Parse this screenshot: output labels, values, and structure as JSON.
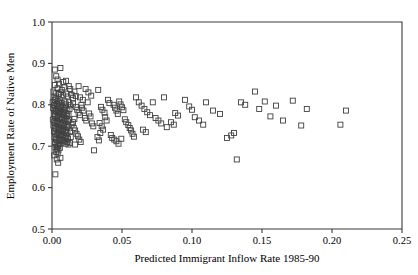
{
  "chart_data": {
    "type": "scatter",
    "title": "",
    "xlabel": "Predicted Immigrant Inflow Rate 1985-90",
    "ylabel": "Employment Rate of Native Men",
    "xlim": [
      0.0,
      0.25
    ],
    "ylim": [
      0.5,
      1.0
    ],
    "xticks": [
      0.0,
      0.05,
      0.1,
      0.15,
      0.2,
      0.25
    ],
    "xticklabels": [
      "0.00",
      "0.05",
      "0.10",
      "0.15",
      "0.20",
      "0.25"
    ],
    "yticks": [
      0.5,
      0.6,
      0.7,
      0.8,
      0.9,
      1.0
    ],
    "yticklabels": [
      "0.5",
      "0.6",
      "0.7",
      "0.8",
      "0.9",
      "1.0"
    ],
    "grid": false,
    "legend": null,
    "marker": "open-square",
    "marker_color": "#404040",
    "marker_size": 5,
    "series": [
      {
        "name": "metro areas",
        "points": [
          [
            0.002,
            0.885
          ],
          [
            0.006,
            0.889
          ],
          [
            0.004,
            0.861
          ],
          [
            0.003,
            0.869
          ],
          [
            0.005,
            0.851
          ],
          [
            0.008,
            0.855
          ],
          [
            0.01,
            0.858
          ],
          [
            0.012,
            0.845
          ],
          [
            0.002,
            0.848
          ],
          [
            0.004,
            0.84
          ],
          [
            0.007,
            0.836
          ],
          [
            0.009,
            0.842
          ],
          [
            0.013,
            0.838
          ],
          [
            0.016,
            0.832
          ],
          [
            0.019,
            0.845
          ],
          [
            0.024,
            0.838
          ],
          [
            0.001,
            0.832
          ],
          [
            0.003,
            0.828
          ],
          [
            0.005,
            0.826
          ],
          [
            0.006,
            0.83
          ],
          [
            0.008,
            0.823
          ],
          [
            0.01,
            0.827
          ],
          [
            0.011,
            0.82
          ],
          [
            0.014,
            0.824
          ],
          [
            0.015,
            0.816
          ],
          [
            0.017,
            0.821
          ],
          [
            0.02,
            0.818
          ],
          [
            0.022,
            0.812
          ],
          [
            0.001,
            0.818
          ],
          [
            0.002,
            0.812
          ],
          [
            0.003,
            0.815
          ],
          [
            0.004,
            0.809
          ],
          [
            0.005,
            0.806
          ],
          [
            0.006,
            0.811
          ],
          [
            0.007,
            0.804
          ],
          [
            0.009,
            0.808
          ],
          [
            0.01,
            0.801
          ],
          [
            0.012,
            0.806
          ],
          [
            0.013,
            0.799
          ],
          [
            0.015,
            0.803
          ],
          [
            0.0005,
            0.806
          ],
          [
            0.0015,
            0.8
          ],
          [
            0.0025,
            0.797
          ],
          [
            0.0035,
            0.802
          ],
          [
            0.0045,
            0.794
          ],
          [
            0.0055,
            0.798
          ],
          [
            0.0065,
            0.791
          ],
          [
            0.0075,
            0.795
          ],
          [
            0.0085,
            0.788
          ],
          [
            0.0095,
            0.792
          ],
          [
            0.011,
            0.786
          ],
          [
            0.0125,
            0.79
          ],
          [
            0.0008,
            0.792
          ],
          [
            0.0018,
            0.787
          ],
          [
            0.0028,
            0.784
          ],
          [
            0.0038,
            0.789
          ],
          [
            0.0048,
            0.781
          ],
          [
            0.0058,
            0.785
          ],
          [
            0.0068,
            0.778
          ],
          [
            0.0078,
            0.782
          ],
          [
            0.0088,
            0.776
          ],
          [
            0.0098,
            0.78
          ],
          [
            0.0108,
            0.773
          ],
          [
            0.0118,
            0.777
          ],
          [
            0.0012,
            0.778
          ],
          [
            0.0022,
            0.773
          ],
          [
            0.0032,
            0.77
          ],
          [
            0.0042,
            0.775
          ],
          [
            0.0052,
            0.768
          ],
          [
            0.0062,
            0.771
          ],
          [
            0.0072,
            0.765
          ],
          [
            0.0082,
            0.769
          ],
          [
            0.0092,
            0.762
          ],
          [
            0.0102,
            0.766
          ],
          [
            0.0112,
            0.76
          ],
          [
            0.0122,
            0.764
          ],
          [
            0.0006,
            0.764
          ],
          [
            0.0016,
            0.759
          ],
          [
            0.0026,
            0.756
          ],
          [
            0.0036,
            0.761
          ],
          [
            0.0046,
            0.754
          ],
          [
            0.0056,
            0.757
          ],
          [
            0.0066,
            0.751
          ],
          [
            0.0076,
            0.755
          ],
          [
            0.0086,
            0.748
          ],
          [
            0.0096,
            0.752
          ],
          [
            0.0106,
            0.746
          ],
          [
            0.0116,
            0.75
          ],
          [
            0.001,
            0.75
          ],
          [
            0.002,
            0.745
          ],
          [
            0.003,
            0.742
          ],
          [
            0.004,
            0.747
          ],
          [
            0.005,
            0.74
          ],
          [
            0.006,
            0.743
          ],
          [
            0.007,
            0.737
          ],
          [
            0.008,
            0.741
          ],
          [
            0.009,
            0.734
          ],
          [
            0.01,
            0.738
          ],
          [
            0.011,
            0.732
          ],
          [
            0.013,
            0.736
          ],
          [
            0.0014,
            0.736
          ],
          [
            0.0024,
            0.731
          ],
          [
            0.0034,
            0.728
          ],
          [
            0.0044,
            0.733
          ],
          [
            0.0054,
            0.726
          ],
          [
            0.0064,
            0.729
          ],
          [
            0.0074,
            0.723
          ],
          [
            0.0084,
            0.727
          ],
          [
            0.0094,
            0.72
          ],
          [
            0.0104,
            0.724
          ],
          [
            0.0114,
            0.718
          ],
          [
            0.0134,
            0.722
          ],
          [
            0.0018,
            0.722
          ],
          [
            0.0028,
            0.717
          ],
          [
            0.0038,
            0.714
          ],
          [
            0.0048,
            0.719
          ],
          [
            0.0058,
            0.712
          ],
          [
            0.0068,
            0.715
          ],
          [
            0.0078,
            0.709
          ],
          [
            0.0088,
            0.713
          ],
          [
            0.0098,
            0.706
          ],
          [
            0.0108,
            0.71
          ],
          [
            0.0118,
            0.704
          ],
          [
            0.0128,
            0.708
          ],
          [
            0.0022,
            0.708
          ],
          [
            0.0032,
            0.703
          ],
          [
            0.0042,
            0.7
          ],
          [
            0.0052,
            0.705
          ],
          [
            0.0026,
            0.698
          ],
          [
            0.0036,
            0.694
          ],
          [
            0.0046,
            0.69
          ],
          [
            0.0056,
            0.696
          ],
          [
            0.003,
            0.686
          ],
          [
            0.004,
            0.682
          ],
          [
            0.0016,
            0.678
          ],
          [
            0.006,
            0.672
          ],
          [
            0.0034,
            0.668
          ],
          [
            0.0044,
            0.66
          ],
          [
            0.0024,
            0.632
          ],
          [
            0.017,
            0.795
          ],
          [
            0.018,
            0.788
          ],
          [
            0.019,
            0.781
          ],
          [
            0.02,
            0.775
          ],
          [
            0.021,
            0.8
          ],
          [
            0.0215,
            0.793
          ],
          [
            0.0225,
            0.786
          ],
          [
            0.0235,
            0.768
          ],
          [
            0.0245,
            0.762
          ],
          [
            0.0255,
            0.806
          ],
          [
            0.0265,
            0.779
          ],
          [
            0.0275,
            0.772
          ],
          [
            0.0285,
            0.755
          ],
          [
            0.0295,
            0.748
          ],
          [
            0.016,
            0.766
          ],
          [
            0.015,
            0.758
          ],
          [
            0.014,
            0.752
          ],
          [
            0.0155,
            0.744
          ],
          [
            0.0165,
            0.738
          ],
          [
            0.0175,
            0.73
          ],
          [
            0.0185,
            0.724
          ],
          [
            0.0195,
            0.716
          ],
          [
            0.0205,
            0.71
          ],
          [
            0.0165,
            0.704
          ],
          [
            0.03,
            0.69
          ],
          [
            0.028,
            0.822
          ],
          [
            0.026,
            0.83
          ],
          [
            0.033,
            0.836
          ],
          [
            0.035,
            0.795
          ],
          [
            0.036,
            0.788
          ],
          [
            0.0375,
            0.781
          ],
          [
            0.038,
            0.77
          ],
          [
            0.039,
            0.762
          ],
          [
            0.04,
            0.812
          ],
          [
            0.041,
            0.804
          ],
          [
            0.034,
            0.756
          ],
          [
            0.0355,
            0.748
          ],
          [
            0.0365,
            0.74
          ],
          [
            0.0345,
            0.732
          ],
          [
            0.042,
            0.727
          ],
          [
            0.043,
            0.72
          ],
          [
            0.0325,
            0.722
          ],
          [
            0.0335,
            0.714
          ],
          [
            0.044,
            0.8
          ],
          [
            0.045,
            0.793
          ],
          [
            0.046,
            0.786
          ],
          [
            0.047,
            0.778
          ],
          [
            0.048,
            0.808
          ],
          [
            0.049,
            0.801
          ],
          [
            0.05,
            0.794
          ],
          [
            0.051,
            0.787
          ],
          [
            0.052,
            0.765
          ],
          [
            0.053,
            0.758
          ],
          [
            0.0545,
            0.751
          ],
          [
            0.0555,
            0.744
          ],
          [
            0.0565,
            0.738
          ],
          [
            0.0575,
            0.73
          ],
          [
            0.0585,
            0.723
          ],
          [
            0.0495,
            0.718
          ],
          [
            0.046,
            0.712
          ],
          [
            0.0475,
            0.706
          ],
          [
            0.0445,
            0.716
          ],
          [
            0.06,
            0.818
          ],
          [
            0.062,
            0.806
          ],
          [
            0.064,
            0.798
          ],
          [
            0.066,
            0.79
          ],
          [
            0.068,
            0.782
          ],
          [
            0.07,
            0.775
          ],
          [
            0.072,
            0.806
          ],
          [
            0.074,
            0.768
          ],
          [
            0.076,
            0.762
          ],
          [
            0.078,
            0.755
          ],
          [
            0.08,
            0.818
          ],
          [
            0.082,
            0.746
          ],
          [
            0.085,
            0.758
          ],
          [
            0.087,
            0.752
          ],
          [
            0.088,
            0.78
          ],
          [
            0.09,
            0.774
          ],
          [
            0.065,
            0.74
          ],
          [
            0.067,
            0.734
          ],
          [
            0.095,
            0.812
          ],
          [
            0.098,
            0.796
          ],
          [
            0.1,
            0.788
          ],
          [
            0.102,
            0.77
          ],
          [
            0.105,
            0.762
          ],
          [
            0.108,
            0.752
          ],
          [
            0.11,
            0.806
          ],
          [
            0.115,
            0.786
          ],
          [
            0.12,
            0.778
          ],
          [
            0.125,
            0.72
          ],
          [
            0.128,
            0.726
          ],
          [
            0.13,
            0.732
          ],
          [
            0.132,
            0.668
          ],
          [
            0.135,
            0.806
          ],
          [
            0.138,
            0.8
          ],
          [
            0.145,
            0.832
          ],
          [
            0.148,
            0.79
          ],
          [
            0.152,
            0.808
          ],
          [
            0.156,
            0.772
          ],
          [
            0.16,
            0.798
          ],
          [
            0.165,
            0.762
          ],
          [
            0.172,
            0.81
          ],
          [
            0.178,
            0.75
          ],
          [
            0.182,
            0.79
          ],
          [
            0.206,
            0.752
          ],
          [
            0.21,
            0.786
          ]
        ]
      }
    ]
  },
  "axis_geometry": {
    "plot_left_px": 52,
    "plot_right_px": 402,
    "plot_top_px": 22,
    "plot_bottom_px": 229
  }
}
